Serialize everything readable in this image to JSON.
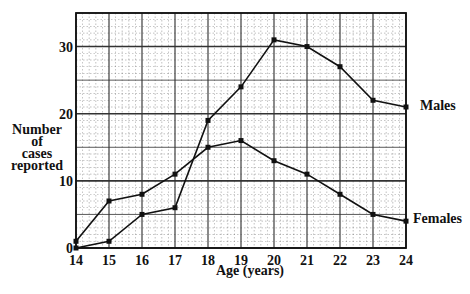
{
  "chart_data": {
    "type": "line",
    "title": "",
    "xlabel": "Age (years)",
    "ylabel": "Number of cases reported",
    "ylabel_lines": [
      "Number",
      "of",
      "cases",
      "reported"
    ],
    "x": [
      14,
      15,
      16,
      17,
      18,
      19,
      20,
      21,
      22,
      23,
      24
    ],
    "x_tick_labels": [
      "14",
      "15",
      "16",
      "17",
      "18",
      "19",
      "20",
      "21",
      "22",
      "23",
      "24"
    ],
    "y_tick_values": [
      0,
      10,
      20,
      30
    ],
    "y_tick_labels": [
      "0",
      "10",
      "20",
      "30"
    ],
    "xlim": [
      14,
      24
    ],
    "ylim": [
      0,
      35
    ],
    "grid": true,
    "legend_position": "inline-right",
    "series": [
      {
        "name": "Males",
        "values": [
          0,
          1,
          5,
          6,
          19,
          24,
          31,
          30,
          27,
          22,
          21
        ]
      },
      {
        "name": "Females",
        "values": [
          1,
          7,
          8,
          11,
          15,
          16,
          13,
          11,
          8,
          5,
          4
        ]
      }
    ],
    "line_color": "#111111",
    "grid_color": "#333333"
  }
}
